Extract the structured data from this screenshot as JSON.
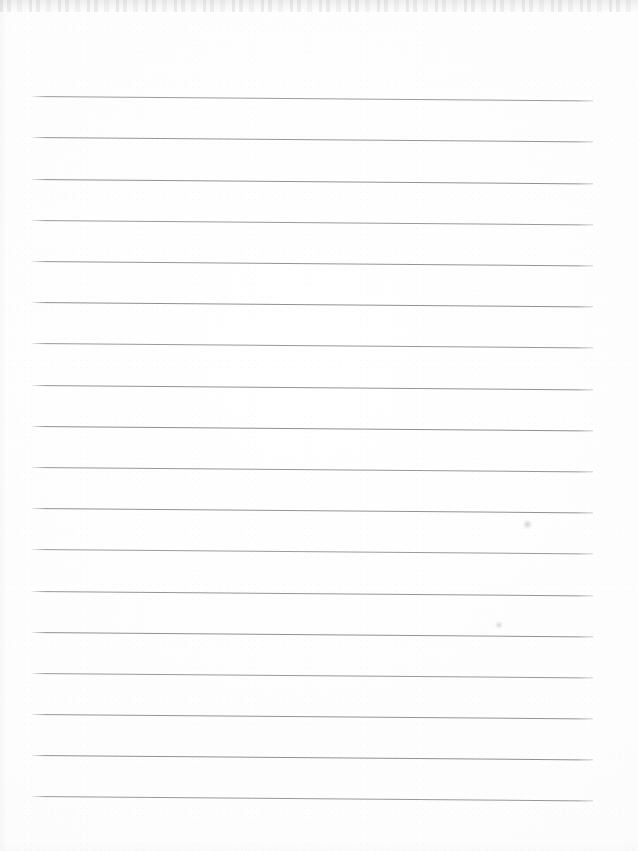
{
  "document": {
    "kind": "scanned-lined-paper",
    "title": "Blank ruled notebook page",
    "page_width": 638,
    "page_height": 851,
    "background_color": "#fdfdfd",
    "written_content": "",
    "visible_text": ""
  },
  "ruling": {
    "line_color": "#8b8b8e",
    "line_thickness_px": 1,
    "line_count": 18,
    "left_x": 32,
    "right_x": 593,
    "first_line_y": 96,
    "spacing_px": 41.2,
    "tilt_degrees": 0.45,
    "lines_y": [
      96,
      137,
      179,
      220,
      261,
      302,
      343,
      385,
      426,
      467,
      508,
      549,
      591,
      632,
      673,
      714,
      755,
      796
    ]
  },
  "artifacts": {
    "top_edge_band": {
      "label": "scanner-edge-noise",
      "height_px": 12,
      "color": "#9a9a9f"
    },
    "marks": [
      {
        "label": "faint-pencil-smudge",
        "x": 522,
        "y": 520,
        "width": 11,
        "height": 9
      },
      {
        "label": "faint-pencil-dot",
        "x": 495,
        "y": 621,
        "width": 8,
        "height": 8
      }
    ]
  }
}
